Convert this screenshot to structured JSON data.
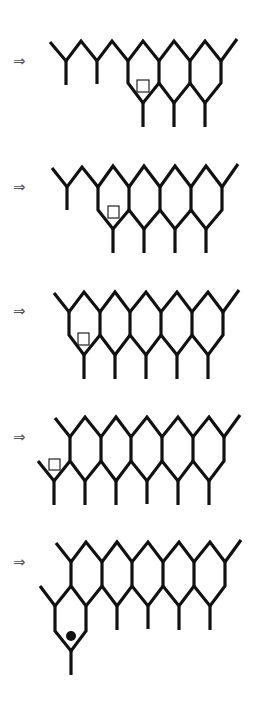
{
  "diagram": {
    "arrow_glyph": "⇒",
    "colors": {
      "line": "#111111",
      "arrow": "#555555",
      "marker": "#222222"
    },
    "steps": [
      {
        "index": 1,
        "arrow": "⇒",
        "complete_cells_top_row": 3,
        "marker": "square"
      },
      {
        "index": 2,
        "arrow": "⇒",
        "complete_cells_top_row": 4,
        "marker": "square"
      },
      {
        "index": 3,
        "arrow": "⇒",
        "complete_cells_top_row": 5,
        "marker": "square"
      },
      {
        "index": 4,
        "arrow": "⇒",
        "complete_cells_top_row": 5,
        "marker": "square"
      },
      {
        "index": 5,
        "arrow": "⇒",
        "complete_cells_top_row": 5,
        "marker": "dot"
      }
    ]
  }
}
